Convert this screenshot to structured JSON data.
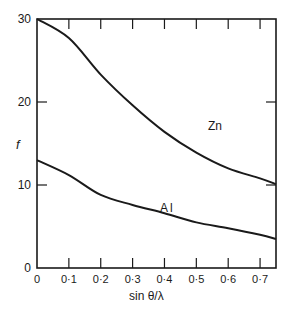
{
  "chart_data": {
    "type": "line",
    "title": "",
    "xlabel": "sin θ/λ",
    "ylabel": "f",
    "xlim": [
      0,
      0.75
    ],
    "ylim": [
      0,
      30
    ],
    "grid": false,
    "legend": "inline labels",
    "x_ticks": [
      "0",
      "0·1",
      "0·2",
      "0·3",
      "0·4",
      "0·5",
      "0·6",
      "0·7"
    ],
    "y_ticks": [
      "0",
      "10",
      "20",
      "30"
    ],
    "x": [
      0,
      0.1,
      0.2,
      0.3,
      0.4,
      0.5,
      0.6,
      0.7,
      0.75
    ],
    "series": [
      {
        "name": "Zn",
        "values": [
          30,
          27.7,
          23.3,
          19.6,
          16.4,
          13.9,
          12.0,
          10.8,
          10.1
        ]
      },
      {
        "name": "Al",
        "values": [
          13,
          11.2,
          8.8,
          7.6,
          6.6,
          5.5,
          4.8,
          4.0,
          3.5
        ]
      }
    ]
  },
  "labels": {
    "zn": "Zn",
    "al": "Al",
    "ylabel": "f",
    "xlabel": "sin θ/λ"
  }
}
